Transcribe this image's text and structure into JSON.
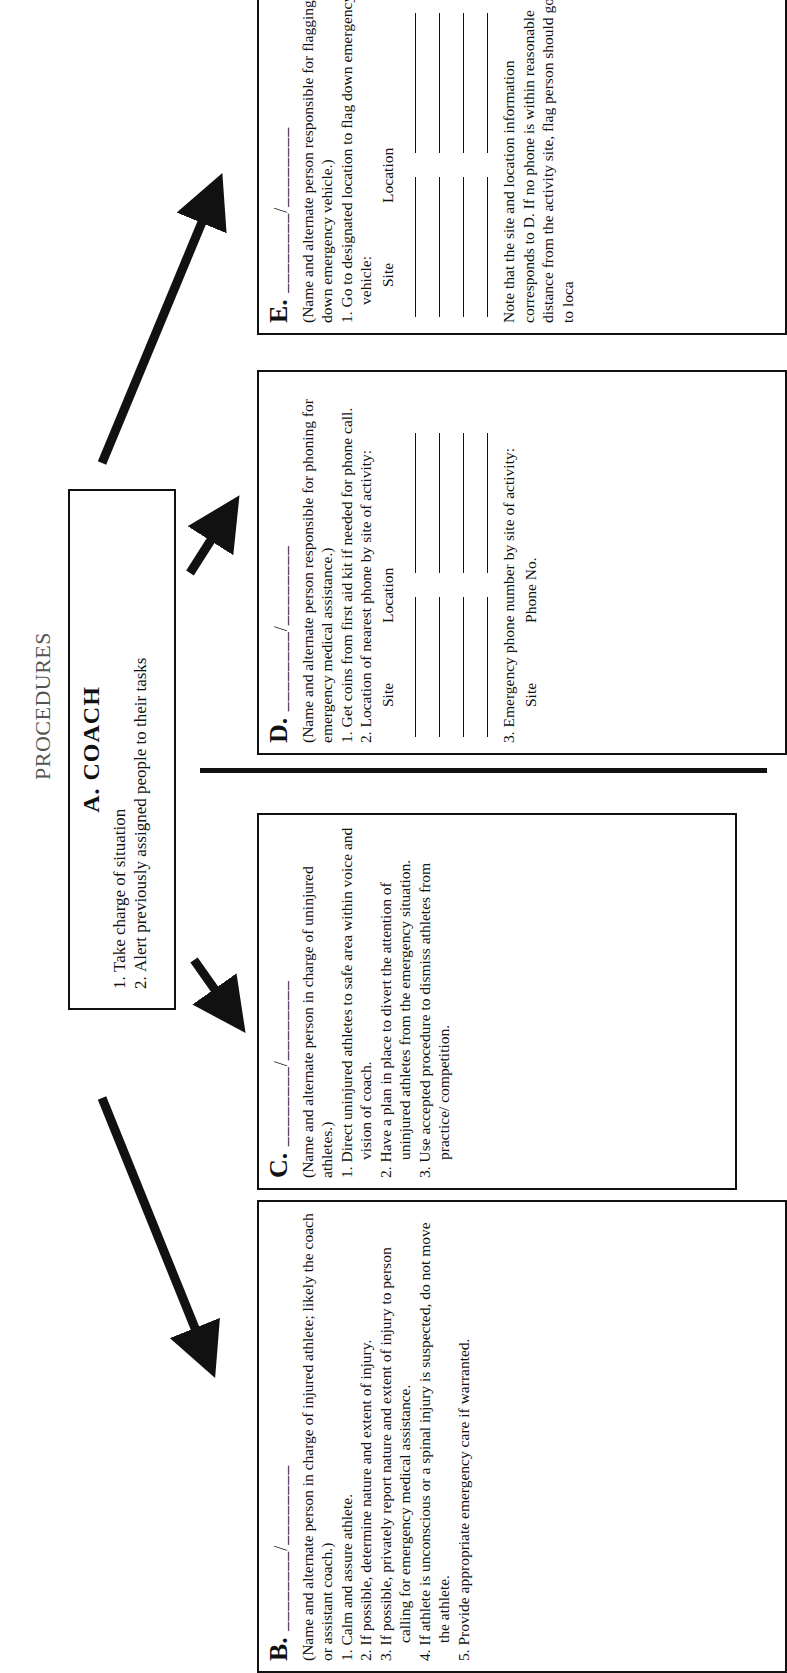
{
  "page": {
    "title": "PROCEDURES"
  },
  "coach": {
    "heading": "A.  COACH",
    "items": [
      "Take charge of situation",
      "Alert previously assigned people to their tasks"
    ]
  },
  "box_b": {
    "letter": "B.",
    "blank": "________/________",
    "intro": "(Name and alternate person in charge of injured athlete; likely the coach or assistant coach.)",
    "items": [
      "1. Calm and assure athlete.",
      "2. If possible, determine nature and extent of injury.",
      "3. If possible, privately report nature and extent of injury to person calling for emergency medical assistance.",
      "4. If athlete is unconscious or a spinal injury is suspected, do not move the athlete.",
      "5. Provide appropriate emergency care if warranted."
    ]
  },
  "box_c": {
    "letter": "C.",
    "blank": "________/________",
    "intro": "(Name and alternate person in charge of uninjured athletes.)",
    "items": [
      "1. Direct uninjured athletes to safe area within voice and vision of coach.",
      "2. Have a plan in place to divert the attention of uninjured athletes from the emergency situation.",
      "3. Use accepted procedure to dismiss athletes from practice/ competition."
    ]
  },
  "box_d": {
    "letter": "D.",
    "blank": "________/________",
    "intro": "(Name and alternate person responsible for phoning for emergency medical assistance.)",
    "items": [
      "1. Get coins from first aid kit if needed for phone call.",
      "2. Location of nearest phone by site of activity:"
    ],
    "table1_headers": [
      "Site",
      "Location"
    ],
    "item3": "3. Emergency phone number by site of activity:",
    "table2_headers": [
      "Site",
      "Phone No."
    ]
  },
  "box_e": {
    "letter": "E.",
    "blank": "________/________",
    "intro": "(Name and alternate person responsible for flagging down emergency vehicle.)",
    "items": [
      "1. Go to designated location to flag down emergency vehicle:"
    ],
    "table_headers": [
      "Site",
      "Location"
    ],
    "note": "Note that the site and location information corresponds to D. If no phone is within reasonable distance from the activity site, flag person should go to loca"
  }
}
